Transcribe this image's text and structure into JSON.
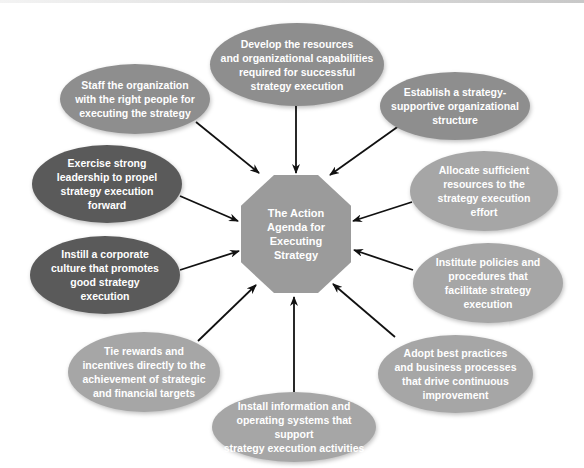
{
  "diagram": {
    "type": "hub-and-spoke",
    "center": {
      "label": "The Action Agenda for Executing Strategy",
      "lines": [
        "The Action",
        "Agenda for",
        "Executing",
        "Strategy"
      ],
      "shape": "octagon",
      "color": "#9b9b9b"
    },
    "nodes": [
      {
        "id": "develop",
        "lines": [
          "Develop the resources",
          "and organizational capabilities",
          "required for successful",
          "strategy execution"
        ],
        "color": "#8e8e8e"
      },
      {
        "id": "establish",
        "lines": [
          "Establish a strategy-",
          "supportive organizational",
          "structure"
        ],
        "color": "#8e8e8e"
      },
      {
        "id": "allocate",
        "lines": [
          "Allocate sufficient",
          "resources to the",
          "strategy execution",
          "effort"
        ],
        "color": "#a6a6a6"
      },
      {
        "id": "institute",
        "lines": [
          "Institute policies and",
          "procedures that",
          "facilitate strategy",
          "execution"
        ],
        "color": "#a6a6a6"
      },
      {
        "id": "adopt",
        "lines": [
          "Adopt best practices",
          "and business processes",
          "that drive continuous",
          "improvement"
        ],
        "color": "#a6a6a6"
      },
      {
        "id": "install",
        "lines": [
          "Install information and",
          "operating systems that support",
          "strategy execution activities"
        ],
        "color": "#a6a6a6"
      },
      {
        "id": "tie",
        "lines": [
          "Tie rewards and",
          "incentives directly to the",
          "achievement of strategic",
          "and financial targets"
        ],
        "color": "#a6a6a6"
      },
      {
        "id": "instill",
        "lines": [
          "Instill a corporate",
          "culture that promotes",
          "good strategy",
          "execution"
        ],
        "color": "#5a5a5a"
      },
      {
        "id": "exercise",
        "lines": [
          "Exercise strong",
          "leadership to propel",
          "strategy execution",
          "forward"
        ],
        "color": "#5a5a5a"
      },
      {
        "id": "staff",
        "lines": [
          "Staff the organization",
          "with the right people for",
          "executing the strategy"
        ],
        "color": "#8e8e8e"
      }
    ],
    "edges": "each outer node points with an arrow into the center"
  }
}
